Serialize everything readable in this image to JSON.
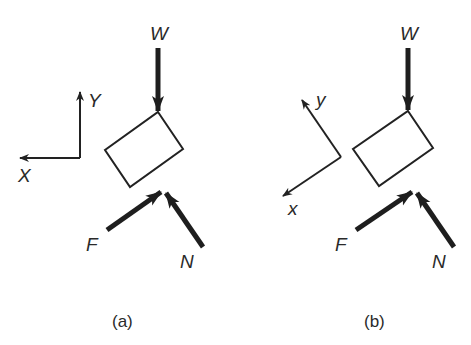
{
  "figure": {
    "panels": [
      {
        "id": "a",
        "caption": "(a)",
        "axes": {
          "x_label": "X",
          "y_label": "Y",
          "orientation": "aligned with page (X left, Y up)"
        },
        "forces": [
          {
            "label": "W",
            "direction": "down"
          },
          {
            "label": "F",
            "direction": "up-right"
          },
          {
            "label": "N",
            "direction": "up-left"
          }
        ],
        "body": "tilted rectangular block"
      },
      {
        "id": "b",
        "caption": "(b)",
        "axes": {
          "x_label": "x",
          "y_label": "y",
          "orientation": "rotated (x down-left, y up-left)"
        },
        "forces": [
          {
            "label": "W",
            "direction": "down"
          },
          {
            "label": "F",
            "direction": "up-right"
          },
          {
            "label": "N",
            "direction": "up-left"
          }
        ],
        "body": "tilted rectangular block"
      }
    ],
    "colors": {
      "ink": "#222222",
      "background": "#ffffff"
    }
  }
}
